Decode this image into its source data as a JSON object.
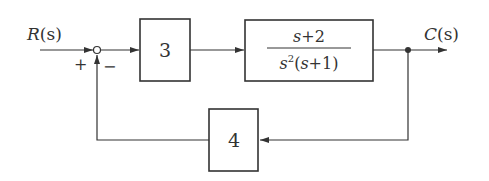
{
  "diagram": {
    "type": "feedback-control-block-diagram",
    "input": {
      "label": "R(s)",
      "symbol": "R",
      "arg": "(s)"
    },
    "output": {
      "label": "C(s)",
      "symbol": "C",
      "arg": "(s)"
    },
    "summing_junction": {
      "plus_sign": "+",
      "minus_sign": "−"
    },
    "blocks": [
      {
        "id": "controller",
        "label": "3"
      },
      {
        "id": "plant",
        "numerator": "s+2",
        "denominator": "s²(s+1)",
        "num_parts": {
          "s": "s",
          "plus": "+",
          "c": "2"
        },
        "den_parts": {
          "s": "s",
          "exp": "2",
          "open": "(",
          "s2": "s",
          "plus": "+",
          "c": "1",
          "close": ")"
        }
      },
      {
        "id": "feedback",
        "label": "4"
      }
    ],
    "colors": {
      "line": "#333333",
      "background": "#ffffff"
    }
  }
}
